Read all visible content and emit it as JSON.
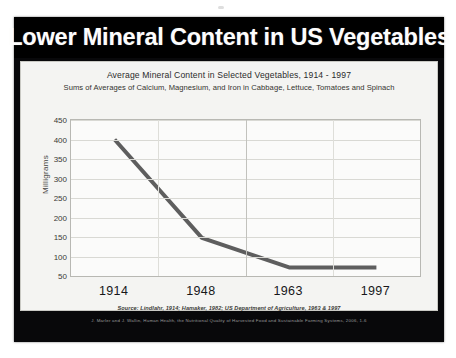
{
  "slide": {
    "title": "Lower Mineral Content in US Vegetables",
    "background_color": "#08080a",
    "title_color": "#ffffff"
  },
  "chart_panel": {
    "background_color": "#f4f4f2",
    "source_note": "Source: Lindlahr, 1914; Hamaker, 1982; US Department of Agriculture, 1963 & 1997"
  },
  "footer": {
    "citation": "J. Marler and J. Wallin, Human Health, the Nutritional Quality of Harvested Food and Sustainable Farming Systems, 2006, 1-6"
  },
  "chart_data": {
    "type": "line",
    "title": "Average Mineral Content in Selected Vegetables, 1914 - 1997",
    "subtitle": "Sums of Averages of Calcium, Magnesium, and Iron in Cabbage, Lettuce, Tomatoes and Spinach",
    "categories": [
      "1914",
      "1948",
      "1963",
      "1997"
    ],
    "values": [
      400,
      148,
      72,
      72
    ],
    "xlabel": "",
    "ylabel": "Milligrams",
    "ylim": [
      50,
      450
    ],
    "yticks": [
      450,
      400,
      350,
      300,
      250,
      200,
      150,
      100,
      50
    ],
    "ytick_labels": [
      "450",
      "400",
      "350",
      "300",
      "250",
      "200",
      "150",
      "100",
      "50"
    ],
    "grid": "horizontal-and-vertical",
    "legend": "none",
    "series_color": "#5e5e5e",
    "line_width_px": 4
  }
}
